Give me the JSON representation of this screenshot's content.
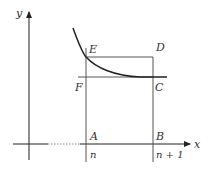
{
  "diagram": {
    "axes": {
      "x_label": "x",
      "y_label": "y",
      "color": "#222222"
    },
    "points": {
      "A": "A",
      "B": "B",
      "C": "C",
      "D": "D",
      "E": "E",
      "F": "F"
    },
    "ticks": {
      "n": "n",
      "n_plus_1": "n + 1"
    },
    "colors": {
      "curve": "#222222",
      "lines": "#555555",
      "background": "#ffffff"
    }
  }
}
